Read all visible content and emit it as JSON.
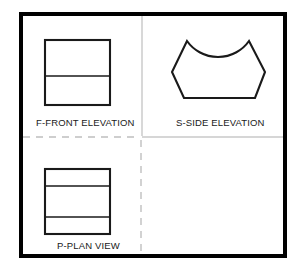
{
  "sheet": {
    "title": "Orthographic Projection Drawing Sheet",
    "background_color": "#ffffff",
    "border_color": "#000000",
    "line_color": "#1a1a1a",
    "divider_color": "#b4b4b4",
    "border": {
      "x": 19,
      "y": 12,
      "width": 268,
      "height": 246,
      "stroke_width": 4
    },
    "dividers": {
      "vertical_top": {
        "x": 142,
        "y1": 14,
        "y2": 136,
        "style": "solid",
        "color": "#c8c8c8"
      },
      "vertical_bottom": {
        "x": 141,
        "y1": 139,
        "y2": 256,
        "style": "dashed",
        "color": "#bfbfbf"
      },
      "horizontal_left": {
        "y": 137,
        "x1": 21,
        "x2": 140,
        "style": "dashed",
        "color": "#bfbfbf"
      },
      "horizontal_right": {
        "y": 137,
        "x1": 142,
        "x2": 285,
        "style": "solid",
        "color": "#c8c8c8"
      }
    }
  },
  "views": {
    "front": {
      "label": "F-FRONT ELEVATION",
      "code": "F",
      "name": "FRONT ELEVATION",
      "quadrant": "top-left",
      "shape": "rectangle-with-one-horizontal-divider",
      "outline": {
        "x": 45,
        "y": 40,
        "width": 65,
        "height": 65
      },
      "internal_lines": [
        {
          "type": "horizontal",
          "y": 76,
          "x1": 45,
          "x2": 110
        }
      ]
    },
    "side": {
      "label": "S-SIDE ELEVATION",
      "code": "S",
      "name": "SIDE ELEVATION",
      "quadrant": "top-right",
      "shape": "hexagonal-block-with-concave-arc-top",
      "vertices": [
        {
          "name": "top-left-peak",
          "x": 187,
          "y": 41
        },
        {
          "name": "left-mid",
          "x": 172,
          "y": 72
        },
        {
          "name": "bottom-left",
          "x": 184,
          "y": 98
        },
        {
          "name": "bottom-right",
          "x": 255,
          "y": 98
        },
        {
          "name": "right-mid",
          "x": 265,
          "y": 72
        },
        {
          "name": "top-right-peak",
          "x": 249,
          "y": 41
        }
      ],
      "arc": {
        "from": {
          "x": 187,
          "y": 41
        },
        "to": {
          "x": 249,
          "y": 41
        },
        "sagitta": 36,
        "concave": true,
        "description": "concave arc dipping down between the two top peaks"
      }
    },
    "plan": {
      "label": "P-PLAN VIEW",
      "code": "P",
      "name": "PLAN VIEW",
      "quadrant": "bottom-left",
      "shape": "rectangle-with-two-horizontal-dividers",
      "outline": {
        "x": 45,
        "y": 169,
        "width": 65,
        "height": 65
      },
      "internal_lines": [
        {
          "type": "horizontal",
          "y": 186,
          "x1": 45,
          "x2": 110
        },
        {
          "type": "horizontal",
          "y": 217,
          "x1": 45,
          "x2": 110
        }
      ]
    }
  }
}
